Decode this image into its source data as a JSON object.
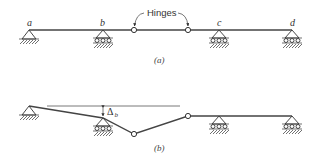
{
  "figure": {
    "panel_a": {
      "caption": "(a)",
      "callout": "Hinges",
      "supports": [
        {
          "label": "a",
          "type": "pin"
        },
        {
          "label": "b",
          "type": "roller"
        },
        {
          "label": "c",
          "type": "roller"
        },
        {
          "label": "d",
          "type": "roller"
        }
      ],
      "hinge_count": 2
    },
    "panel_b": {
      "caption": "(b)",
      "displacement_label": "Δ",
      "displacement_subscript": "b"
    }
  },
  "colors": {
    "line": "#444444",
    "background": "#ffffff"
  }
}
